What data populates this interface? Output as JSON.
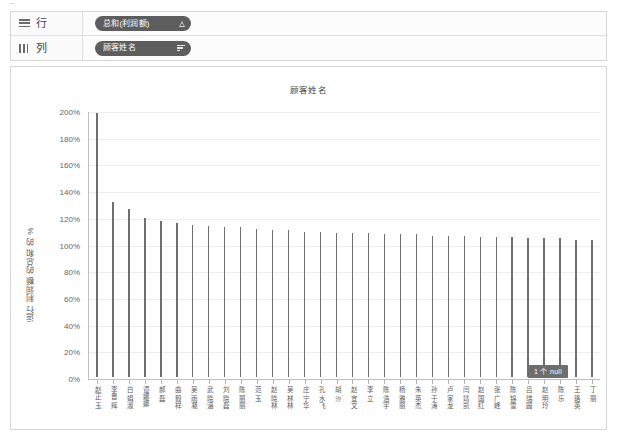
{
  "shelves": {
    "rows": {
      "label": "行",
      "icon": "rows-icon",
      "pill": {
        "text": "总和(利润额)",
        "icon": "triangle-measure-icon"
      }
    },
    "columns": {
      "label": "列",
      "icon": "columns-icon",
      "pill": {
        "text": "顾客姓名",
        "icon": "sort-descending-icon"
      }
    }
  },
  "chart_data": {
    "type": "bar",
    "title": "顾客姓名",
    "xlabel": "",
    "ylabel": "运行 利润额 的总和 的 %",
    "ylim": [
      0,
      200
    ],
    "ytick_labels": [
      "0%",
      "20%",
      "40%",
      "60%",
      "80%",
      "100%",
      "120%",
      "140%",
      "160%",
      "180%",
      "200%"
    ],
    "ytick_values": [
      0,
      20,
      40,
      60,
      80,
      100,
      120,
      140,
      160,
      180,
      200
    ],
    "grid": true,
    "legend": "none",
    "bar_color": "#6f6f6f",
    "categories": [
      "赵正 玉",
      "李晋 辉",
      "白 娟淑",
      "谭娜娜",
      "郝 磊",
      "曲 毅祥",
      "吴 雨凝",
      "武 晓涵",
      "刘 晓磊",
      "陈 丽丽",
      "范 玉",
      "赵 晓林",
      "吴 林林",
      "庄 宁华",
      "孔 水飞",
      "胡 沙",
      "赵 宜文",
      "李 立",
      "陈 浩宇",
      "杨 雅丽",
      "朱 英杰",
      "孙 于涛",
      "卢 家龙",
      "闫 靖凯",
      "赵 国红",
      "张 广峰",
      "陈 锦雪",
      "吕 瑞圆",
      "赵 明玲",
      "陈 乐",
      "王 珞英",
      "丁 丽"
    ],
    "values": [
      198,
      131,
      126,
      119,
      117,
      115,
      114,
      113,
      112,
      112,
      111,
      110,
      110,
      109,
      109,
      108,
      108,
      108,
      107,
      107,
      107,
      106,
      106,
      106,
      105,
      105,
      105,
      104,
      104,
      104,
      103,
      103
    ]
  },
  "null_badge": {
    "text": "1 个 null"
  }
}
